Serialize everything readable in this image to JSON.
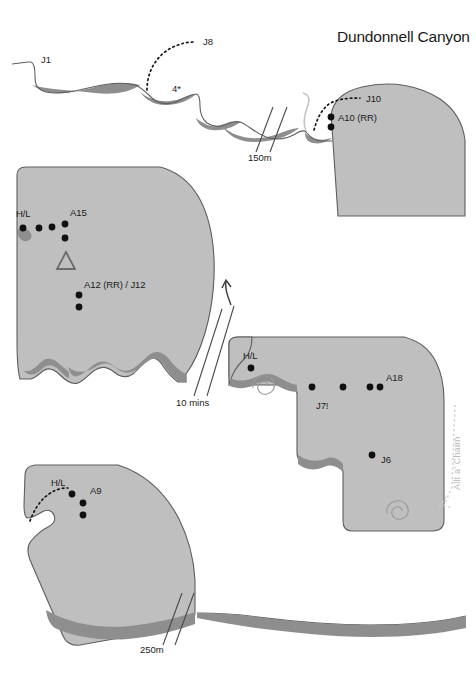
{
  "title": "Dundonnell Canyon",
  "figure": {
    "type": "canyon-profile-topo",
    "colors": {
      "rock_fill": "#bfbfbf",
      "rock_stroke": "#5e5e5e",
      "pool_fill": "#8e8e8e",
      "marker": "#101010",
      "stream_label": "#b9b9b9",
      "background": "#ffffff"
    },
    "stream_label": "Allt a' Chairn"
  },
  "panels": [
    {
      "id": "panel-1",
      "name": "upper-canyon-section",
      "labels": [
        {
          "id": "J1",
          "text": "J1",
          "x": 41,
          "y": 63
        },
        {
          "id": "J8",
          "text": "J8",
          "x": 203,
          "y": 43
        },
        {
          "id": "star4",
          "text": "4*",
          "x": 172,
          "y": 91
        },
        {
          "id": "J10",
          "text": "J10",
          "x": 368,
          "y": 101
        },
        {
          "id": "A10RR",
          "text": "A10 (RR)",
          "x": 337,
          "y": 119
        }
      ],
      "scale_break": {
        "text": "150m",
        "x": 248,
        "y": 152
      }
    },
    {
      "id": "panel-2",
      "name": "middle-left-section",
      "labels": [
        {
          "id": "HL-2",
          "text": "H/L",
          "x": 16,
          "y": 217
        },
        {
          "id": "A15",
          "text": "A15",
          "x": 70,
          "y": 216
        },
        {
          "id": "A12RR-J12",
          "text": "A12 (RR) / J12",
          "x": 84,
          "y": 286
        }
      ],
      "scale_break": {
        "text": "10 mins",
        "x": 176,
        "y": 404
      }
    },
    {
      "id": "panel-3",
      "name": "middle-right-section",
      "labels": [
        {
          "id": "HL-3",
          "text": "H/L",
          "x": 243,
          "y": 357
        },
        {
          "id": "J7",
          "text": "J7!",
          "x": 316,
          "y": 407
        },
        {
          "id": "A18",
          "text": "A18",
          "x": 386,
          "y": 380
        },
        {
          "id": "J6",
          "text": "J6",
          "x": 382,
          "y": 462
        }
      ]
    },
    {
      "id": "panel-4",
      "name": "lower-left-section",
      "labels": [
        {
          "id": "HL-4",
          "text": "H/L",
          "x": 51,
          "y": 484
        },
        {
          "id": "A9",
          "text": "A9",
          "x": 90,
          "y": 492
        }
      ],
      "scale_break": {
        "text": "250m",
        "x": 140,
        "y": 650
      }
    }
  ],
  "markers": {
    "abseil_dots": [
      {
        "panel": "panel-1",
        "x": 331,
        "y": 117
      },
      {
        "panel": "panel-1",
        "x": 331,
        "y": 127
      },
      {
        "panel": "panel-2",
        "x": 23,
        "y": 228
      },
      {
        "panel": "panel-2",
        "x": 39,
        "y": 228
      },
      {
        "panel": "panel-2",
        "x": 52,
        "y": 226
      },
      {
        "panel": "panel-2",
        "x": 66,
        "y": 224
      },
      {
        "panel": "panel-2",
        "x": 66,
        "y": 236
      },
      {
        "panel": "panel-2",
        "x": 80,
        "y": 295
      },
      {
        "panel": "panel-2",
        "x": 80,
        "y": 306
      },
      {
        "panel": "panel-3",
        "x": 251,
        "y": 368
      },
      {
        "panel": "panel-3",
        "x": 312,
        "y": 387
      },
      {
        "panel": "panel-3",
        "x": 342,
        "y": 387
      },
      {
        "panel": "panel-3",
        "x": 371,
        "y": 387
      },
      {
        "panel": "panel-3",
        "x": 380,
        "y": 387
      },
      {
        "panel": "panel-3",
        "x": 372,
        "y": 455
      },
      {
        "panel": "panel-4",
        "x": 73,
        "y": 495
      },
      {
        "panel": "panel-4",
        "x": 83,
        "y": 503
      },
      {
        "panel": "panel-4",
        "x": 83,
        "y": 515
      }
    ],
    "triangle": {
      "panel": "panel-2",
      "x": 66,
      "y": 262
    },
    "spirals": [
      {
        "panel": "panel-3",
        "x": 266,
        "y": 386
      },
      {
        "panel": "panel-3",
        "x": 400,
        "y": 511
      }
    ]
  }
}
